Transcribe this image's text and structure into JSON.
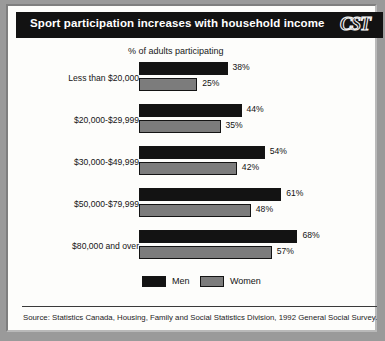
{
  "header": {
    "title": "Sport participation increases with household income",
    "logo": "CST"
  },
  "footer": {
    "source": "Source: Statistics Canada, Housing, Family and Social Statistics Division, 1992 General Social Survey."
  },
  "legend": {
    "men_label": "Men",
    "women_label": "Women"
  },
  "colors": {
    "men": "#131313",
    "women": "#7c7c7c",
    "title_band": "#121212",
    "paper": "#fdfdfb",
    "page_background": "#9a9a9a"
  },
  "chart_data": {
    "type": "bar",
    "orientation": "horizontal",
    "title": "Sport participation increases with household income",
    "xlabel": "% of adults participating",
    "ylabel": "",
    "grid": false,
    "legend_position": "bottom",
    "xlim": [
      0,
      70
    ],
    "categories": [
      "Less than $20,000",
      "$20,000-$29,999",
      "$30,000-$49,999",
      "$50,000-$79,999",
      "$80,000 and over"
    ],
    "series": [
      {
        "name": "Men",
        "values": [
          38,
          44,
          54,
          61,
          68
        ],
        "labels": [
          "38%",
          "44%",
          "54%",
          "61%",
          "68%"
        ]
      },
      {
        "name": "Women",
        "values": [
          25,
          35,
          42,
          48,
          57
        ],
        "labels": [
          "25%",
          "35%",
          "42%",
          "48%",
          "57%"
        ]
      }
    ]
  }
}
